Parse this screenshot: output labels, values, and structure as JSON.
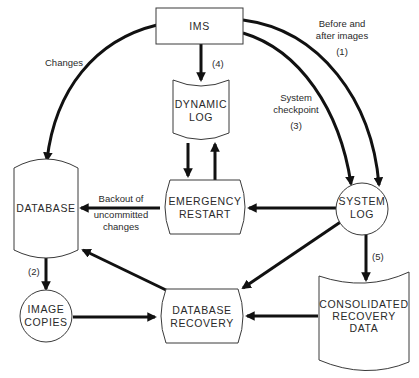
{
  "diagram": {
    "title": "",
    "nodes": {
      "ims": {
        "label": "IMS",
        "shape": "rectangle"
      },
      "dynamic_log": {
        "label_line1": "DYNAMIC",
        "label_line2": "LOG",
        "shape": "document"
      },
      "emergency_restart": {
        "label_line1": "EMERGENCY",
        "label_line2": "RESTART",
        "shape": "process-barrel"
      },
      "database": {
        "label": "DATABASE",
        "shape": "cylinder"
      },
      "system_log": {
        "label_line1": "SYSTEM",
        "label_line2": "LOG",
        "shape": "circle"
      },
      "image_copies": {
        "label_line1": "IMAGE",
        "label_line2": "COPIES",
        "shape": "circle"
      },
      "database_recovery": {
        "label_line1": "DATABASE",
        "label_line2": "RECOVERY",
        "shape": "process-barrel"
      },
      "consolidated_recovery_data": {
        "label_line1": "CONSOLIDATED",
        "label_line2": "RECOVERY",
        "label_line3": "DATA",
        "shape": "document"
      }
    },
    "edges": {
      "ims_to_database": {
        "from": "IMS",
        "to": "DATABASE",
        "label": "Changes"
      },
      "ims_to_system_log_images": {
        "from": "IMS",
        "to": "SYSTEM LOG",
        "label_line1": "Before and",
        "label_line2": "after images",
        "step": "(1)"
      },
      "ims_to_system_log_checkpoint": {
        "from": "IMS",
        "to": "SYSTEM LOG",
        "label_line1": "System",
        "label_line2": "checkpoint",
        "step": "(3)"
      },
      "ims_to_dynamic_log": {
        "from": "IMS",
        "to": "DYNAMIC LOG",
        "step": "(4)"
      },
      "dynamic_log_to_emergency_restart": {
        "from": "DYNAMIC LOG",
        "to": "EMERGENCY RESTART"
      },
      "emergency_restart_to_dynamic_log": {
        "from": "EMERGENCY RESTART",
        "to": "DYNAMIC LOG"
      },
      "emergency_restart_to_database": {
        "from": "EMERGENCY RESTART",
        "to": "DATABASE",
        "label_line1": "Backout of",
        "label_line2": "uncommitted",
        "label_line3": "changes"
      },
      "system_log_to_emergency_restart": {
        "from": "SYSTEM LOG",
        "to": "EMERGENCY RESTART"
      },
      "database_to_image_copies": {
        "from": "DATABASE",
        "to": "IMAGE COPIES",
        "step": "(2)"
      },
      "database_recovery_to_database": {
        "from": "DATABASE RECOVERY",
        "to": "DATABASE"
      },
      "system_log_to_database_recovery": {
        "from": "SYSTEM LOG",
        "to": "DATABASE RECOVERY"
      },
      "system_log_to_consolidated": {
        "from": "SYSTEM LOG",
        "to": "CONSOLIDATED RECOVERY DATA",
        "step": "(5)"
      },
      "image_copies_to_database_recovery": {
        "from": "IMAGE COPIES",
        "to": "DATABASE RECOVERY"
      },
      "consolidated_to_database_recovery": {
        "from": "CONSOLIDATED RECOVERY DATA",
        "to": "DATABASE RECOVERY"
      }
    }
  }
}
